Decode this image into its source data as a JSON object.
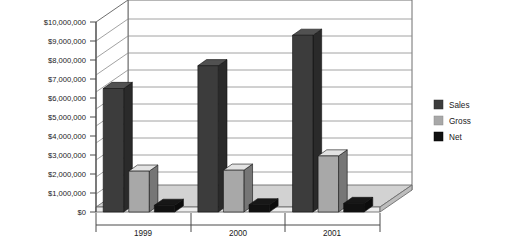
{
  "chart_data": {
    "type": "bar",
    "title": "",
    "subtitle": "",
    "xlabel": "",
    "ylabel": "",
    "categories": [
      "1999",
      "2000",
      "2001"
    ],
    "series": [
      {
        "name": "Sales",
        "values": [
          6500000,
          7700000,
          9300000
        ],
        "color": "#3c3c3c"
      },
      {
        "name": "Gross",
        "values": [
          2150000,
          2200000,
          2950000
        ],
        "color": "#a8a8a8"
      },
      {
        "name": "Net",
        "values": [
          350000,
          380000,
          450000
        ],
        "color": "#111111"
      }
    ],
    "ylim": [
      0,
      10000000
    ],
    "ytick_values": [
      0,
      1000000,
      2000000,
      3000000,
      4000000,
      5000000,
      6000000,
      7000000,
      8000000,
      9000000,
      10000000
    ],
    "ytick_labels": [
      "$0",
      "$1,000,000",
      "$2,000,000",
      "$3,000,000",
      "$4,000,000",
      "$5,000,000",
      "$6,000,000",
      "$7,000,000",
      "$8,000,000",
      "$9,000,000",
      "$10,000,000"
    ],
    "grid": true,
    "grid_axis": "y",
    "legend_position": "right",
    "three_d": true,
    "plot_background": "#ffffff",
    "grid_color": "#808080",
    "frame_color": "#6e6e6e"
  },
  "yaxis": {
    "t0": "$0",
    "t1": "$1,000,000",
    "t2": "$2,000,000",
    "t3": "$3,000,000",
    "t4": "$4,000,000",
    "t5": "$5,000,000",
    "t6": "$6,000,000",
    "t7": "$7,000,000",
    "t8": "$8,000,000",
    "t9": "$9,000,000",
    "t10": "$10,000,000"
  },
  "xaxis": {
    "c0": "1999",
    "c1": "2000",
    "c2": "2001"
  },
  "legend": {
    "items": [
      {
        "label": "Sales",
        "swatch": "#3c3c3c"
      },
      {
        "label": "Gross",
        "swatch": "#a8a8a8"
      },
      {
        "label": "Net",
        "swatch": "#111111"
      }
    ],
    "l0": "Sales",
    "l1": "Gross",
    "l2": "Net"
  }
}
